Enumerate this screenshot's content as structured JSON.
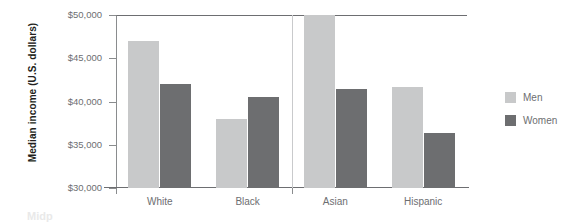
{
  "chart_data": {
    "type": "bar",
    "title": "",
    "subtitle": "",
    "xlabel": "",
    "ylabel": "Median income (U.S. dollars)",
    "categories": [
      "White",
      "Black",
      "Asian",
      "Hispanic"
    ],
    "series": [
      {
        "name": "Men",
        "color": "#c8c9ca",
        "values": [
          47000,
          38000,
          50000,
          41700
        ]
      },
      {
        "name": "Women",
        "color": "#6d6e70",
        "values": [
          42000,
          40500,
          41400,
          36400
        ]
      }
    ],
    "ylim": [
      30000,
      50000
    ],
    "yticks": [
      30000,
      35000,
      40000,
      45000,
      50000
    ],
    "ytick_labels": [
      "$30,000",
      "$35,000",
      "$40,000",
      "$45,000",
      "$50,000"
    ],
    "grid": false,
    "legend_position": "right",
    "note": "Asian men bar is clipped at the top of the plot area"
  },
  "legend": {
    "items": [
      {
        "label": "Men",
        "color": "#c8c9ca"
      },
      {
        "label": "Women",
        "color": "#6d6e70"
      }
    ]
  },
  "caption_fragment": "Midp"
}
